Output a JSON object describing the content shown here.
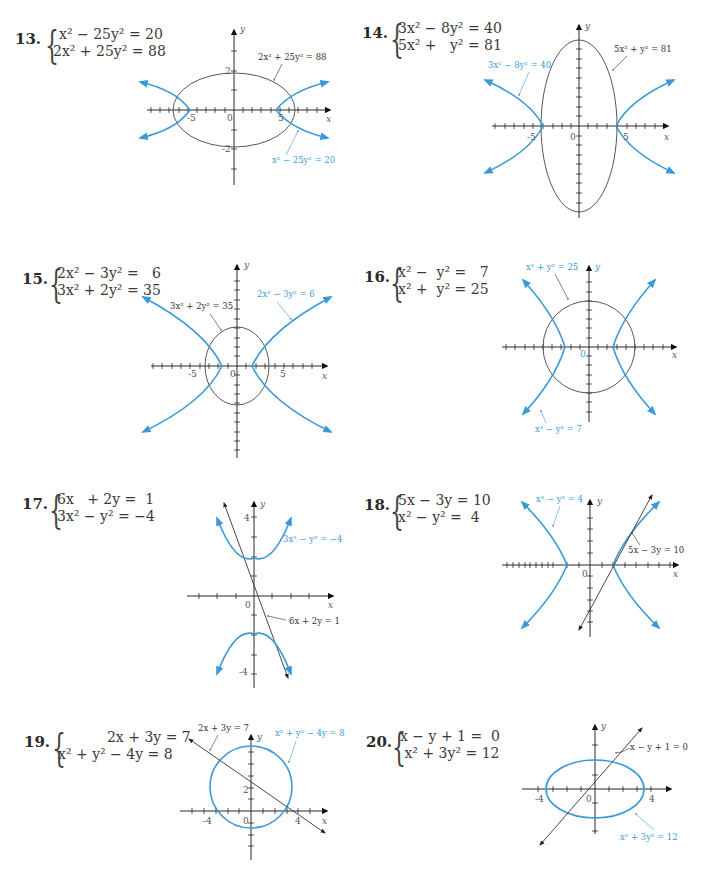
{
  "colors": {
    "blue": "#3a9ad9",
    "black": "#333333",
    "text": "#3a3a3a"
  },
  "problems": [
    {
      "number": "13.",
      "equations": [
        "x² − 25y² = 20",
        "2x² + 25y² = 88"
      ],
      "graph_labels": {
        "curve1": "2x² + 25y² = 88",
        "curve2": "x² − 25y² = 20"
      },
      "ticks": {
        "x_pos": "5",
        "x_neg": "-5",
        "origin": "0",
        "y_pos": "2",
        "y_neg": "-2"
      },
      "axes": {
        "x": "x",
        "y": "y"
      }
    },
    {
      "number": "14.",
      "equations": [
        "3x² − 8y² = 40",
        "5x² +   y² = 81"
      ],
      "graph_labels": {
        "curve1": "5x² + y² = 81",
        "curve2": "3x² − 8y² = 40"
      },
      "ticks": {
        "x_pos": "5",
        "x_neg": "-5",
        "origin": "0"
      },
      "axes": {
        "x": "x",
        "y": "y"
      }
    },
    {
      "number": "15.",
      "equations": [
        "2x² − 3y² =   6",
        "3x² + 2y² = 35"
      ],
      "graph_labels": {
        "curve1": "3x² + 2y² = 35",
        "curve2": "2x² − 3y² = 6"
      },
      "ticks": {
        "x_pos": "5",
        "x_neg": "-5",
        "origin": "0"
      },
      "axes": {
        "x": "x",
        "y": "y"
      }
    },
    {
      "number": "16.",
      "equations": [
        "x² −  y² =   7",
        "x² +  y² = 25"
      ],
      "graph_labels": {
        "curve1": "x² + y² = 25",
        "curve2": "x² − y² = 7"
      },
      "ticks": {
        "origin": "0"
      },
      "axes": {
        "x": "x",
        "y": "y"
      }
    },
    {
      "number": "17.",
      "equations": [
        "6x   + 2y =  1",
        "3x² − y² = −4"
      ],
      "graph_labels": {
        "curve1": "3x² − y² = −4",
        "curve2": "6x + 2y = 1"
      },
      "ticks": {
        "origin": "0",
        "y_pos": "4",
        "y_neg": "-4"
      },
      "axes": {
        "x": "x",
        "y": "y"
      }
    },
    {
      "number": "18.",
      "equations": [
        "5x − 3y = 10",
        "x² − y² =  4"
      ],
      "graph_labels": {
        "curve1": "x² − y² = 4",
        "curve2": "5x − 3y = 10"
      },
      "ticks": {
        "origin": "0"
      },
      "axes": {
        "x": "x",
        "y": "y"
      }
    },
    {
      "number": "19.",
      "equations": [
        "           2x + 3y = 7",
        "x² + y² − 4y = 8"
      ],
      "graph_labels": {
        "curve1": "2x + 3y = 7",
        "curve2": "x² + y² − 4y = 8"
      },
      "ticks": {
        "x_pos": "4",
        "x_neg": "-4",
        "origin": "0",
        "y_pos": "2"
      },
      "axes": {
        "x": "x",
        "y": "y"
      }
    },
    {
      "number": "20.",
      "equations": [
        "x − y + 1 =  0",
        " x² + 3y² = 12"
      ],
      "graph_labels": {
        "curve1": "x − y + 1 = 0",
        "curve2": "x² + 3y² = 12"
      },
      "ticks": {
        "x_pos": "4",
        "x_neg": "-4",
        "origin": "0"
      },
      "axes": {
        "x": "x",
        "y": "y"
      }
    }
  ]
}
